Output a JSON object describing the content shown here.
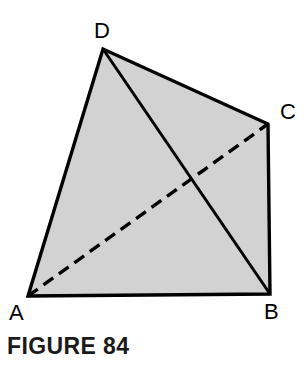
{
  "figure": {
    "caption": "FIGURE 84",
    "background_color": "#ffffff",
    "fill_color": "#d2d2d2",
    "stroke_color": "#000000",
    "stroke_width": 3,
    "dash_pattern": "12 7",
    "vertices": [
      {
        "id": "A",
        "label": "A",
        "x": 28,
        "y": 296
      },
      {
        "id": "B",
        "label": "B",
        "x": 270,
        "y": 294
      },
      {
        "id": "C",
        "label": "C",
        "x": 268,
        "y": 124
      },
      {
        "id": "D",
        "label": "D",
        "x": 103,
        "y": 49
      }
    ],
    "outline_path": "M 28 296 L 103 49 L 268 124 L 270 294 Z",
    "edges": [
      {
        "name": "edge-AD",
        "from": "A",
        "to": "D",
        "style": "solid"
      },
      {
        "name": "edge-DC",
        "from": "D",
        "to": "C",
        "style": "solid"
      },
      {
        "name": "edge-CB",
        "from": "C",
        "to": "B",
        "style": "solid"
      },
      {
        "name": "edge-BA",
        "from": "B",
        "to": "A",
        "style": "solid"
      },
      {
        "name": "diagonal-DB",
        "from": "D",
        "to": "B",
        "style": "solid"
      },
      {
        "name": "diagonal-AC",
        "from": "A",
        "to": "C",
        "style": "dashed"
      }
    ]
  }
}
